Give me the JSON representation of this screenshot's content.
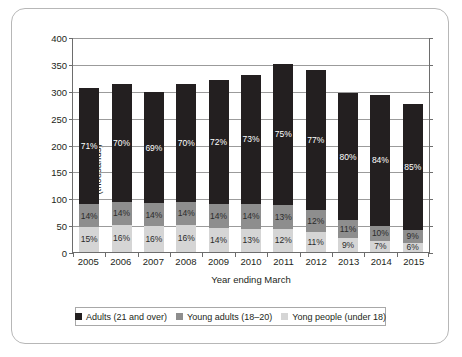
{
  "chart_data": {
    "type": "bar",
    "subtype": "stacked-vertical",
    "title": "",
    "xlabel": "Year ending March",
    "ylabel": "Number of people\n(thousands)",
    "ylim": [
      0,
      400
    ],
    "yticks": [
      0,
      50,
      100,
      150,
      200,
      250,
      300,
      350,
      400
    ],
    "grid": true,
    "legend_position": "bottom",
    "categories": [
      "2005",
      "2006",
      "2007",
      "2008",
      "2009",
      "2010",
      "2011",
      "2012",
      "2013",
      "2014",
      "2015"
    ],
    "totals": [
      305,
      312,
      301,
      312,
      320,
      330,
      350,
      338,
      295,
      293,
      275
    ],
    "series": [
      {
        "name": "Adults  (21 and over)",
        "color": "#231f20",
        "values": [
          71,
          70,
          69,
          70,
          72,
          73,
          75,
          77,
          80,
          84,
          85
        ],
        "labels": [
          "71%",
          "70%",
          "69%",
          "70%",
          "72%",
          "73%",
          "75%",
          "77%",
          "80%",
          "84%",
          "85%"
        ]
      },
      {
        "name": "Young adults (18–20)",
        "color": "#8e8e8e",
        "values": [
          14,
          14,
          14,
          14,
          14,
          14,
          13,
          12,
          11,
          10,
          9
        ],
        "labels": [
          "14%",
          "14%",
          "14%",
          "14%",
          "14%",
          "14%",
          "13%",
          "12%",
          "11%",
          "10%",
          "9%"
        ]
      },
      {
        "name": "Yong people (under 18)",
        "color": "#d5d5d5",
        "values": [
          15,
          16,
          16,
          16,
          14,
          13,
          12,
          11,
          9,
          7,
          6
        ],
        "labels": [
          "15%",
          "16%",
          "16%",
          "16%",
          "14%",
          "13%",
          "12%",
          "11%",
          "9%",
          "7%",
          "6%"
        ]
      }
    ]
  },
  "legend": {
    "items": [
      {
        "label": "Adults  (21 and over)",
        "color": "#231f20"
      },
      {
        "label": "Young adults (18–20)",
        "color": "#8e8e8e"
      },
      {
        "label": "Yong people (under 18)",
        "color": "#d5d5d5"
      }
    ]
  }
}
